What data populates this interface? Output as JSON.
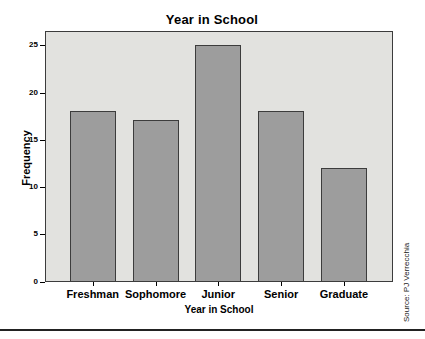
{
  "chart_data": {
    "type": "bar",
    "title": "Year in School",
    "categories": [
      "Freshman",
      "Sophomore",
      "Junior",
      "Senior",
      "Graduate"
    ],
    "values": [
      18,
      17,
      25,
      18,
      12
    ],
    "xlabel": "Year in School",
    "ylabel": "Frequency",
    "ylim": [
      0,
      26.5
    ],
    "yticks": [
      0,
      5,
      10,
      15,
      20,
      25
    ],
    "grid": false,
    "legend": "none",
    "bar_color": "#9d9d9d",
    "bar_border_color": "#3c3c3c",
    "plot_bg_color": "#e2e2df",
    "plot_border_color": "#3c3c3c",
    "text_color": "#000000"
  },
  "source_credit": "Source: PJ Verrecchia"
}
